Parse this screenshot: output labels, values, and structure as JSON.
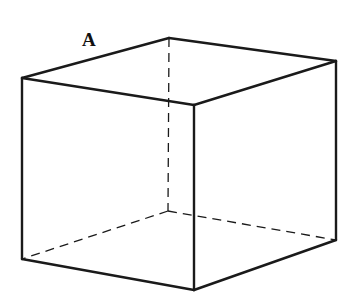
{
  "diagram": {
    "type": "cube-perspective",
    "stroke_color": "#1a1a1a",
    "background": "#ffffff",
    "label": {
      "text": "A",
      "x": 82,
      "y": 46
    },
    "vertices": {
      "top_back": [
        169,
        38
      ],
      "top_left": [
        22,
        78
      ],
      "top_right": [
        336,
        61
      ],
      "top_front": [
        194,
        105
      ],
      "bottom_left": [
        22,
        259
      ],
      "bottom_front": [
        194,
        290
      ],
      "bottom_right": [
        336,
        240
      ],
      "bottom_back_hidden": [
        168,
        211
      ]
    },
    "visible_edges": [
      [
        "top_left",
        "top_back"
      ],
      [
        "top_back",
        "top_right"
      ],
      [
        "top_left",
        "top_front"
      ],
      [
        "top_front",
        "top_right"
      ],
      [
        "top_left",
        "bottom_left"
      ],
      [
        "top_front",
        "bottom_front"
      ],
      [
        "top_right",
        "bottom_right"
      ],
      [
        "bottom_left",
        "bottom_front"
      ],
      [
        "bottom_front",
        "bottom_right"
      ]
    ],
    "hidden_edges": [
      [
        "top_back",
        "bottom_back_hidden"
      ],
      [
        "bottom_back_hidden",
        "bottom_left"
      ],
      [
        "bottom_back_hidden",
        "bottom_right"
      ]
    ]
  }
}
